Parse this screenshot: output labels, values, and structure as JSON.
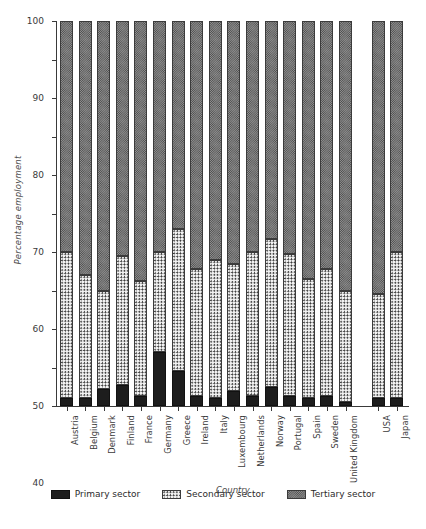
{
  "chart_data": {
    "type": "bar",
    "subtype": "stacked-percentage",
    "title": "",
    "xlabel": "Country",
    "ylabel": "Percentage employment",
    "ylim": [
      0,
      100
    ],
    "ytick_step": 10,
    "yticks": [
      "0",
      "10",
      "20",
      "30",
      "40",
      "50",
      "60",
      "70",
      "80",
      "90",
      "100"
    ],
    "grid": false,
    "legend_position": "bottom-center",
    "categories": [
      "Austria",
      "Belgium",
      "Denmark",
      "Finland",
      "France",
      "Germany",
      "Greece",
      "Ireland",
      "Italy",
      "Luxembourg",
      "Netherlands",
      "Norway",
      "Portugal",
      "Spain",
      "Sweden",
      "United Kingdom",
      "USA",
      "Japan"
    ],
    "group_break_after": "United Kingdom",
    "series": [
      {
        "name": "Primary sector",
        "color": "#1d1d1d",
        "pattern": "solid-black",
        "values": [
          2.0,
          2.0,
          4.5,
          5.5,
          2.5,
          14.0,
          9.0,
          2.5,
          2.0,
          4.0,
          2.5,
          5.0,
          2.5,
          2.0,
          2.5,
          1.0,
          2.0,
          2.0
        ]
      },
      {
        "name": "Secondary sector",
        "color": "#f2f2f2",
        "pattern": "dotted",
        "values": [
          38.0,
          32.0,
          25.5,
          33.5,
          30.0,
          26.0,
          37.0,
          33.0,
          36.0,
          33.0,
          37.5,
          38.5,
          37.0,
          31.0,
          33.0,
          29.0,
          27.0,
          38.0
        ]
      },
      {
        "name": "Tertiary sector",
        "color": "#8f8f8f",
        "pattern": "crosshatch",
        "values": [
          60.0,
          66.0,
          70.0,
          61.0,
          67.5,
          60.0,
          54.0,
          64.5,
          62.0,
          63.0,
          60.0,
          56.5,
          60.5,
          67.0,
          64.5,
          70.0,
          71.0,
          60.0
        ]
      }
    ],
    "cumulative_tops": {
      "primary_plus_secondary": [
        40.0,
        34.0,
        30.0,
        39.0,
        32.5,
        40.0,
        46.0,
        35.5,
        38.0,
        37.0,
        40.0,
        43.5,
        39.5,
        33.0,
        35.5,
        30.0,
        29.0,
        40.0
      ]
    }
  },
  "legend": {
    "items": [
      {
        "label": "Primary sector",
        "swatch": "primary"
      },
      {
        "label": "Secondary sector",
        "swatch": "secondary"
      },
      {
        "label": "Tertiary sector",
        "swatch": "tertiary"
      }
    ]
  }
}
